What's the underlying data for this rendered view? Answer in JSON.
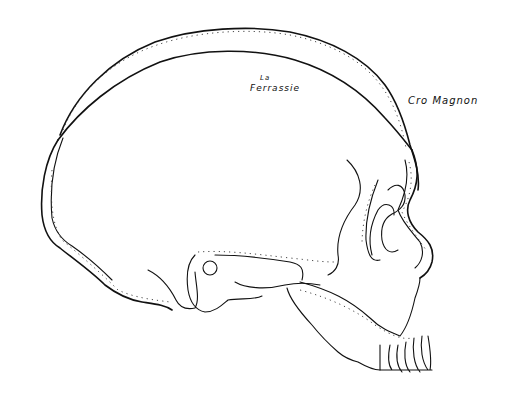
{
  "figure": {
    "labels": {
      "la_ferrassie_line1": "La",
      "la_ferrassie_line2": "Ferrassie",
      "cro_magnon": "Cro Magnon"
    },
    "colors": {
      "ink": "#111111",
      "background": "#ffffff"
    }
  }
}
